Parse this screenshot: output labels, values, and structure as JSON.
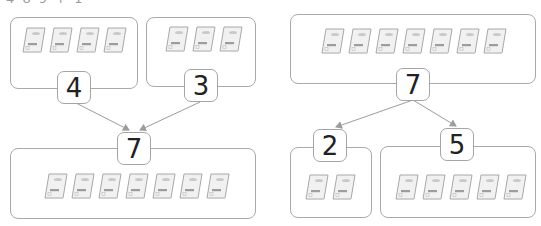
{
  "header": {
    "clipped_text": "4 8 9 + 1"
  },
  "left_diagram": {
    "type": "composition",
    "parts": [
      {
        "value": "4",
        "ticket_count": 4
      },
      {
        "value": "3",
        "ticket_count": 3
      }
    ],
    "whole": {
      "value": "7",
      "ticket_count": 7
    }
  },
  "right_diagram": {
    "type": "decomposition",
    "whole": {
      "value": "7",
      "ticket_count": 7
    },
    "parts": [
      {
        "value": "2",
        "ticket_count": 2
      },
      {
        "value": "5",
        "ticket_count": 5
      }
    ]
  },
  "colors": {
    "border": "#a9a9a9",
    "arrow": "#9c9c9c",
    "ticket": "#bdbdbd",
    "text": "#222222"
  }
}
